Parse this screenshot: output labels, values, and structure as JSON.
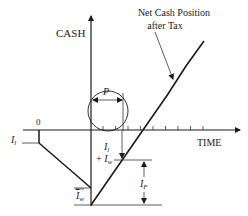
{
  "diagram": {
    "type": "cash-flow-diagram",
    "axes": {
      "y_label": "CASH",
      "x_label": "TIME",
      "origin_label": "0"
    },
    "curve_label": {
      "line1": "Net Cash Position",
      "line2": "after Tax"
    },
    "annotations": {
      "I_l": {
        "base": "I",
        "sub": "l"
      },
      "I_w": {
        "base": "I",
        "sub": "w"
      },
      "I_l_plus_I_w": {
        "line1_base": "I",
        "line1_sub": "l",
        "line2_prefix": "+ ",
        "line2_base": "I",
        "line2_sub": "w"
      },
      "I_F": {
        "base": "I",
        "sub": "F"
      },
      "P": "P"
    },
    "time_ticks_count": 9
  }
}
